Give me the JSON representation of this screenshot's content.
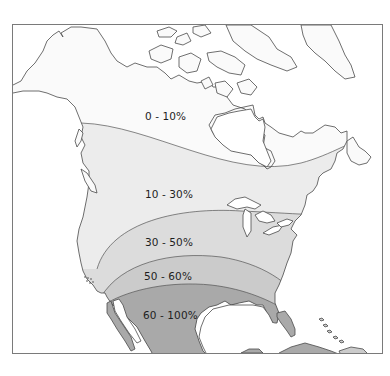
{
  "map": {
    "region": "North America",
    "zones": [
      {
        "label": "0 - 10%",
        "fill": "#fafafa"
      },
      {
        "label": "10 - 30%",
        "fill": "#ececec"
      },
      {
        "label": "30 - 50%",
        "fill": "#dcdcdc"
      },
      {
        "label": "50 - 60%",
        "fill": "#cbcbcb"
      },
      {
        "label": "60 - 100%",
        "fill": "#a9a9a9"
      }
    ],
    "colors": {
      "frame": "#7a7a7a",
      "outline": "#4a4a4a",
      "water": "#ffffff"
    }
  }
}
